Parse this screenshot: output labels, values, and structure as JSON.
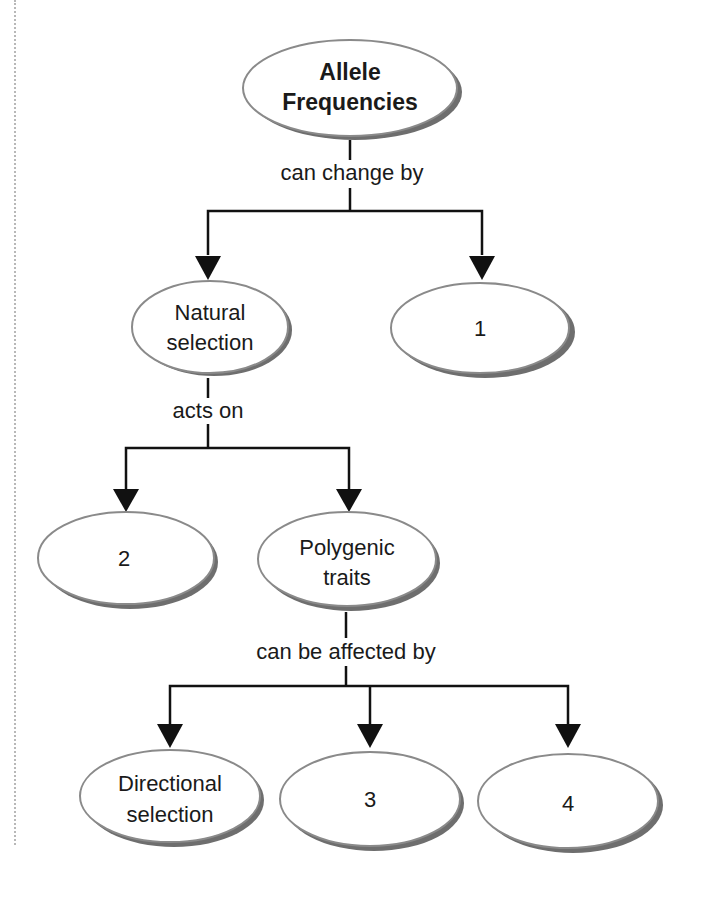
{
  "diagram": {
    "type": "concept-map",
    "nodes": [
      {
        "id": "root",
        "lines": [
          "Allele",
          "Frequencies"
        ],
        "bold": true
      },
      {
        "id": "natural-selection",
        "lines": [
          "Natural",
          "selection"
        ]
      },
      {
        "id": "blank-1",
        "lines": [
          "1"
        ]
      },
      {
        "id": "blank-2",
        "lines": [
          "2"
        ]
      },
      {
        "id": "polygenic-traits",
        "lines": [
          "Polygenic",
          "traits"
        ]
      },
      {
        "id": "directional-selection",
        "lines": [
          "Directional",
          "selection"
        ]
      },
      {
        "id": "blank-3",
        "lines": [
          "3"
        ]
      },
      {
        "id": "blank-4",
        "lines": [
          "4"
        ]
      }
    ],
    "links": [
      {
        "from": "root",
        "label": "can change by",
        "to": [
          "natural-selection",
          "blank-1"
        ]
      },
      {
        "from": "natural-selection",
        "label": "acts on",
        "to": [
          "blank-2",
          "polygenic-traits"
        ]
      },
      {
        "from": "polygenic-traits",
        "label": "can be affected by",
        "to": [
          "directional-selection",
          "blank-3",
          "blank-4"
        ]
      }
    ]
  },
  "colors": {
    "ellipse_fill": "#ffffff",
    "ellipse_stroke": "#8a8a8a",
    "ellipse_shadow": "#6e6e6e",
    "line": "#111111"
  }
}
